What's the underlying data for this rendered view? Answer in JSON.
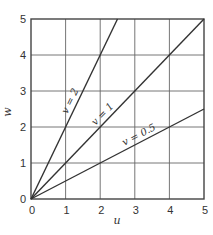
{
  "chart_data": {
    "type": "line",
    "title": "",
    "xlabel": "u",
    "ylabel": "w",
    "xlim": [
      0,
      5
    ],
    "ylim": [
      0,
      5
    ],
    "grid": true,
    "xticks": [
      "0",
      "1",
      "2",
      "3",
      "4",
      "5"
    ],
    "yticks": [
      "0",
      "1",
      "2",
      "3",
      "4",
      "5"
    ],
    "series": [
      {
        "name": "v = 2",
        "slope": 2,
        "x": [
          0,
          2.5
        ],
        "y": [
          0,
          5
        ],
        "label": "v = 2"
      },
      {
        "name": "v = 1",
        "slope": 1,
        "x": [
          0,
          5
        ],
        "y": [
          0,
          5
        ],
        "label": "v = 1"
      },
      {
        "name": "v = 0.5",
        "slope": 0.5,
        "x": [
          0,
          5
        ],
        "y": [
          0,
          2.5
        ],
        "label": "v = 0.5"
      }
    ],
    "legend": "inline labels along lines"
  }
}
